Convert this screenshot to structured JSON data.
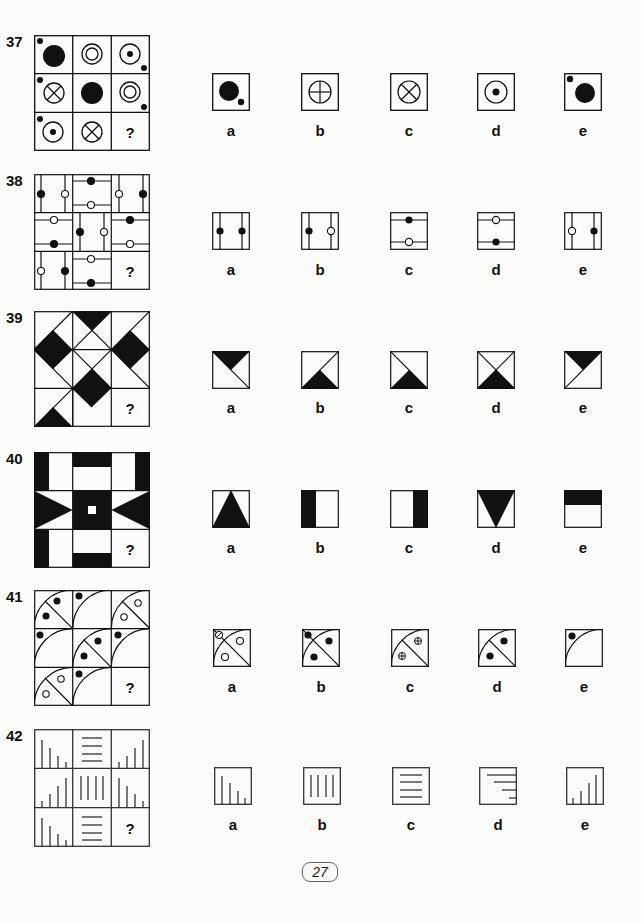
{
  "page": {
    "number": "27"
  },
  "option_letters": [
    "a",
    "b",
    "c",
    "d",
    "e"
  ],
  "questions": [
    {
      "number": "37",
      "missing_mark": "?",
      "grid": [
        "big-dot+corner-dot-tl",
        "double-circle",
        "circle-dot+corner-dot-br",
        "x-circle+corner-dot-tl",
        "big-dot",
        "double-circle+corner-dot-br",
        "circle-dot+corner-dot-tl",
        "x-circle",
        "?"
      ],
      "options": [
        {
          "letter": "a",
          "figure": "big-dot+corner-dot-br"
        },
        {
          "letter": "b",
          "figure": "plus-circle"
        },
        {
          "letter": "c",
          "figure": "x-circle"
        },
        {
          "letter": "d",
          "figure": "circle-dot"
        },
        {
          "letter": "e",
          "figure": "big-dot+corner-dot-tl"
        }
      ]
    },
    {
      "number": "38",
      "missing_mark": "?",
      "options": [
        {
          "letter": "a",
          "figure": "vertical-lines black-black"
        },
        {
          "letter": "b",
          "figure": "vertical-lines black-white"
        },
        {
          "letter": "c",
          "figure": "horizontal-lines black-top white-bottom"
        },
        {
          "letter": "d",
          "figure": "horizontal-lines white-top black-bottom"
        },
        {
          "letter": "e",
          "figure": "vertical-lines white-black"
        }
      ]
    },
    {
      "number": "39",
      "missing_mark": "?",
      "options": [
        {
          "letter": "a",
          "figure": "top-triangle with diagonal tl-br"
        },
        {
          "letter": "b",
          "figure": "bottom-triangle with diagonal bl-tr"
        },
        {
          "letter": "c",
          "figure": "bottom-triangle with diagonal tl-br"
        },
        {
          "letter": "d",
          "figure": "bottom-triangle with both diagonals"
        },
        {
          "letter": "e",
          "figure": "top-triangle with diagonal bl-tr"
        }
      ]
    },
    {
      "number": "40",
      "missing_mark": "?",
      "options": [
        {
          "letter": "a",
          "figure": "upward triangle"
        },
        {
          "letter": "b",
          "figure": "left black bar"
        },
        {
          "letter": "c",
          "figure": "right black bar"
        },
        {
          "letter": "d",
          "figure": "downward triangle"
        },
        {
          "letter": "e",
          "figure": "top black bar"
        }
      ]
    },
    {
      "number": "41",
      "missing_mark": "?",
      "options": [
        {
          "letter": "a",
          "figure": "arc, diagonal, white dots, crossed corner dot"
        },
        {
          "letter": "b",
          "figure": "arc, diagonal, 3 black dots"
        },
        {
          "letter": "c",
          "figure": "arc, half diagonal, 2 crossed dots"
        },
        {
          "letter": "d",
          "figure": "arc, half diagonal, 2 black dots"
        },
        {
          "letter": "e",
          "figure": "arc, corner black dot"
        }
      ]
    },
    {
      "number": "42",
      "missing_mark": "?",
      "options": [
        {
          "letter": "a",
          "figure": "descending bars"
        },
        {
          "letter": "b",
          "figure": "four vertical lines"
        },
        {
          "letter": "c",
          "figure": "four horizontal lines"
        },
        {
          "letter": "d",
          "figure": "descending horizontal lines from right"
        },
        {
          "letter": "e",
          "figure": "ascending bars"
        }
      ]
    }
  ]
}
